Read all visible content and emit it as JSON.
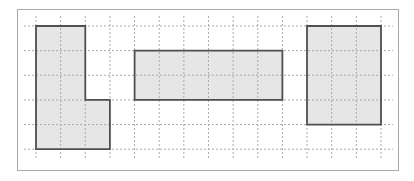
{
  "diagram": {
    "type": "grid-shapes",
    "colors": {
      "background": "#ffffff",
      "frame": "#a8a8a8",
      "grid": "#aaaaaa",
      "shape_fill": "#e6e6e6",
      "shape_stroke": "#505050"
    },
    "grid": {
      "origin_x": 36,
      "origin_y": 26,
      "cell": 24.64,
      "columns": 14,
      "rows": 5,
      "extend": 10
    },
    "shapes": [
      {
        "name": "l-shape",
        "points_cells": [
          [
            0,
            0
          ],
          [
            2,
            0
          ],
          [
            2,
            3
          ],
          [
            3,
            3
          ],
          [
            3,
            5
          ],
          [
            0,
            5
          ]
        ]
      },
      {
        "name": "middle-rectangle",
        "points_cells": [
          [
            4,
            1
          ],
          [
            10,
            1
          ],
          [
            10,
            3
          ],
          [
            4,
            3
          ]
        ]
      },
      {
        "name": "right-rectangle",
        "points_cells": [
          [
            11,
            0
          ],
          [
            14,
            0
          ],
          [
            14,
            4
          ],
          [
            11,
            4
          ]
        ]
      }
    ]
  }
}
